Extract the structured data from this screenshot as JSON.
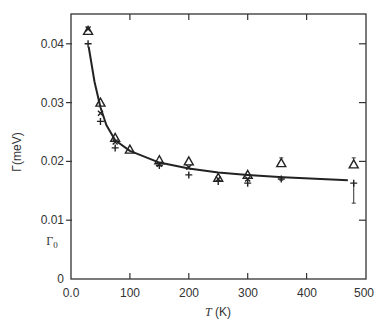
{
  "chart_data": {
    "type": "scatter",
    "title": "",
    "xlabel": "T (K)",
    "ylabel": "Γ(meV)",
    "xlim": [
      0,
      500
    ],
    "ylim": [
      0,
      0.045
    ],
    "x_ticks": [
      "0.0",
      "100",
      "200",
      "300",
      "400",
      "500"
    ],
    "x_tick_values": [
      0,
      100,
      200,
      300,
      400,
      500
    ],
    "y_ticks": [
      "0",
      "0.01",
      "0.02",
      "0.03",
      "0.04"
    ],
    "y_tick_values": [
      0,
      0.01,
      0.02,
      0.03,
      0.04
    ],
    "annotations": [
      {
        "text": "Γ0",
        "x_axis_label": true,
        "y": 0.0065
      }
    ],
    "grid": false,
    "legend": null,
    "series": [
      {
        "name": "triangle",
        "marker": "triangle-open",
        "points": [
          {
            "x": 29,
            "y": 0.0422
          },
          {
            "x": 50,
            "y": 0.03
          },
          {
            "x": 75,
            "y": 0.024
          },
          {
            "x": 100,
            "y": 0.022
          },
          {
            "x": 150,
            "y": 0.0202
          },
          {
            "x": 200,
            "y": 0.02
          },
          {
            "x": 250,
            "y": 0.0172
          },
          {
            "x": 300,
            "y": 0.0177
          },
          {
            "x": 357,
            "y": 0.0197,
            "err_high": 0.0206
          },
          {
            "x": 480,
            "y": 0.0195,
            "err_high": 0.0206
          }
        ]
      },
      {
        "name": "cross",
        "marker": "x",
        "points": [
          {
            "x": 29,
            "y": 0.0425
          },
          {
            "x": 50,
            "y": 0.0282
          },
          {
            "x": 75,
            "y": 0.0233
          },
          {
            "x": 150,
            "y": 0.0195
          },
          {
            "x": 200,
            "y": 0.019
          },
          {
            "x": 250,
            "y": 0.017
          },
          {
            "x": 300,
            "y": 0.017
          }
        ]
      },
      {
        "name": "plus",
        "marker": "plus",
        "points": [
          {
            "x": 29,
            "y": 0.04
          },
          {
            "x": 50,
            "y": 0.0268
          },
          {
            "x": 75,
            "y": 0.0223
          },
          {
            "x": 150,
            "y": 0.0193
          },
          {
            "x": 200,
            "y": 0.0177
          },
          {
            "x": 250,
            "y": 0.0166
          },
          {
            "x": 300,
            "y": 0.0163
          },
          {
            "x": 357,
            "y": 0.017,
            "err_low": 0.0168
          },
          {
            "x": 480,
            "y": 0.0163,
            "err_low": 0.0129
          }
        ]
      },
      {
        "name": "fit",
        "type": "line",
        "points": [
          {
            "x": 30,
            "y": 0.0395
          },
          {
            "x": 40,
            "y": 0.0335
          },
          {
            "x": 50,
            "y": 0.0292
          },
          {
            "x": 60,
            "y": 0.0262
          },
          {
            "x": 75,
            "y": 0.0236
          },
          {
            "x": 100,
            "y": 0.0218
          },
          {
            "x": 150,
            "y": 0.0198
          },
          {
            "x": 200,
            "y": 0.0188
          },
          {
            "x": 250,
            "y": 0.0181
          },
          {
            "x": 300,
            "y": 0.0177
          },
          {
            "x": 360,
            "y": 0.0173
          },
          {
            "x": 470,
            "y": 0.0168
          }
        ]
      }
    ]
  },
  "labels": {
    "ylabel": "Γ(meV)",
    "gamma0": "Γ",
    "gamma0_sub": "0",
    "xlabel_var": "T",
    "xlabel_unit": " (K)",
    "x_ticks": [
      "0.0",
      "100",
      "200",
      "300",
      "400",
      "500"
    ],
    "y_ticks": [
      "0",
      "0.01",
      "0.02",
      "0.03",
      "0.04"
    ]
  }
}
